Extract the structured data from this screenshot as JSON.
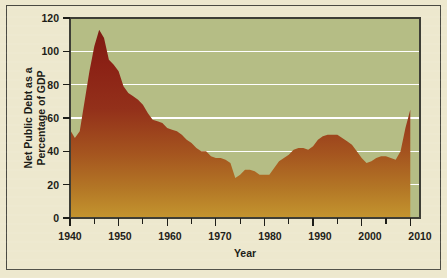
{
  "figure": {
    "background_color": "#EDE8CE",
    "frame_color": "#4a4a42",
    "plot_background_color": "#B5BD85",
    "gridline_color": "#FFFFFF",
    "area_top_color": "#8B2115",
    "area_bottom_color": "#BC8A2E"
  },
  "chart_data": {
    "type": "area",
    "title": "",
    "subtitle": "",
    "xlabel": "Year",
    "ylabel": "Net Public Debt as a Percentage of GDP",
    "ylabel_line1": "Net Public Debt as a",
    "ylabel_line2": "Percentage of GDP",
    "xlim": [
      1940,
      2012
    ],
    "ylim": [
      0,
      120
    ],
    "grid": true,
    "grid_axis": "y",
    "legend": false,
    "legend_position": "none",
    "y_ticks": [
      0,
      20,
      40,
      60,
      80,
      100,
      120
    ],
    "y_tick_labels": [
      "0",
      "20",
      "40",
      "60",
      "80",
      "100",
      "120"
    ],
    "x_ticks": [
      1940,
      1950,
      1960,
      1970,
      1980,
      1990,
      2000,
      2010
    ],
    "x_tick_labels": [
      "1940",
      "1950",
      "1960",
      "1970",
      "1980",
      "1990",
      "2000",
      "2010"
    ],
    "x_minor_ticks": [
      1945,
      1955,
      1965,
      1975,
      1985,
      1995,
      2005
    ],
    "series": [
      {
        "name": "Net Public Debt as a Percentage of GDP",
        "x": [
          1940,
          1941,
          1942,
          1943,
          1944,
          1945,
          1946,
          1947,
          1948,
          1949,
          1950,
          1951,
          1952,
          1953,
          1954,
          1955,
          1956,
          1957,
          1958,
          1959,
          1960,
          1961,
          1962,
          1963,
          1964,
          1965,
          1966,
          1967,
          1968,
          1969,
          1970,
          1971,
          1972,
          1973,
          1974,
          1975,
          1976,
          1977,
          1978,
          1979,
          1980,
          1981,
          1982,
          1983,
          1984,
          1985,
          1986,
          1987,
          1988,
          1989,
          1990,
          1991,
          1992,
          1993,
          1994,
          1995,
          1996,
          1997,
          1998,
          1999,
          2000,
          2001,
          2002,
          2003,
          2004,
          2005,
          2006,
          2007,
          2008,
          2009,
          2010
        ],
        "values": [
          53,
          48,
          52,
          70,
          88,
          103,
          113,
          108,
          95,
          92,
          88,
          79,
          75,
          73,
          71,
          68,
          63,
          59,
          58,
          57,
          54,
          53,
          52,
          50,
          47,
          45,
          42,
          40,
          40,
          37,
          36,
          36,
          35,
          33,
          24,
          26,
          29,
          29,
          28,
          26,
          26,
          26,
          30,
          34,
          36,
          38,
          41,
          42,
          42,
          41,
          43,
          47,
          49,
          50,
          50,
          50,
          48,
          46,
          44,
          40,
          36,
          33,
          34,
          36,
          37,
          37,
          36,
          35,
          40,
          54,
          65
        ]
      }
    ]
  }
}
